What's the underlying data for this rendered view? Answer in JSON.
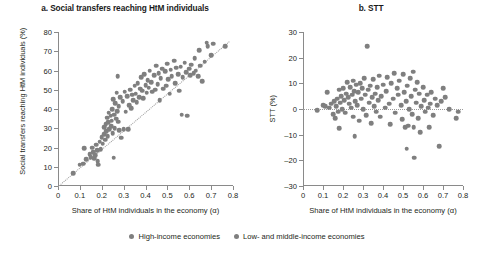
{
  "figure": {
    "panel_a_title": "a. Social transfers reaching HtM individuals",
    "panel_b_title": "b. STT"
  },
  "legend": {
    "items": [
      {
        "label": "High-income economies",
        "color": "#7f7f7f"
      },
      {
        "label": "Low- and middle-income economies",
        "color": "#7f7f7f"
      }
    ]
  },
  "chart_data": [
    {
      "type": "scatter",
      "id": "panel-a",
      "title": "a. Social transfers reaching HtM individuals",
      "xlabel": "Share of HtM individuals in the economy (α)",
      "ylabel": "Social transfers reaching HtM individuals (%)",
      "xlim": [
        0,
        0.8
      ],
      "ylim": [
        0,
        80
      ],
      "xticks": [
        0,
        0.1,
        0.2,
        0.3,
        0.4,
        0.5,
        0.6,
        0.7,
        0.8
      ],
      "xticklabels": [
        "0",
        "0.1",
        "0.2",
        "0.3",
        "0.4",
        "0.5",
        "0.6",
        "0.7",
        "0.8"
      ],
      "yticks": [
        0,
        10,
        20,
        30,
        40,
        50,
        60,
        70,
        80
      ],
      "yticklabels": [
        "0",
        "10",
        "20",
        "30",
        "40",
        "50",
        "60",
        "70",
        "80"
      ],
      "grid": false,
      "marker_color": "#7f7f7f",
      "trendline": {
        "style": "dotted",
        "x0": 0.0,
        "y0": 0.0,
        "x1": 0.78,
        "y1": 75.0
      },
      "points": [
        [
          0.07,
          6.5
        ],
        [
          0.1,
          11.0
        ],
        [
          0.115,
          11.5
        ],
        [
          0.12,
          19.5
        ],
        [
          0.13,
          14.0
        ],
        [
          0.145,
          16.5
        ],
        [
          0.15,
          15.0
        ],
        [
          0.155,
          20.0
        ],
        [
          0.16,
          17.5
        ],
        [
          0.165,
          14.5
        ],
        [
          0.17,
          16.0
        ],
        [
          0.175,
          21.5
        ],
        [
          0.18,
          18.5
        ],
        [
          0.182,
          13.0
        ],
        [
          0.185,
          11.0
        ],
        [
          0.19,
          23.0
        ],
        [
          0.195,
          19.0
        ],
        [
          0.2,
          25.5
        ],
        [
          0.205,
          22.0
        ],
        [
          0.21,
          27.0
        ],
        [
          0.212,
          30.5
        ],
        [
          0.215,
          24.0
        ],
        [
          0.218,
          32.0
        ],
        [
          0.22,
          28.5
        ],
        [
          0.225,
          35.5
        ],
        [
          0.228,
          26.0
        ],
        [
          0.23,
          33.0
        ],
        [
          0.232,
          38.0
        ],
        [
          0.235,
          29.5
        ],
        [
          0.24,
          36.5
        ],
        [
          0.242,
          31.0
        ],
        [
          0.245,
          34.0
        ],
        [
          0.248,
          40.0
        ],
        [
          0.25,
          27.5
        ],
        [
          0.252,
          45.0
        ],
        [
          0.255,
          14.8
        ],
        [
          0.258,
          37.0
        ],
        [
          0.26,
          30.0
        ],
        [
          0.262,
          43.0
        ],
        [
          0.265,
          35.0
        ],
        [
          0.268,
          48.5
        ],
        [
          0.27,
          39.0
        ],
        [
          0.272,
          57.0
        ],
        [
          0.275,
          33.5
        ],
        [
          0.278,
          41.5
        ],
        [
          0.28,
          29.0
        ],
        [
          0.285,
          46.0
        ],
        [
          0.29,
          25.0
        ],
        [
          0.295,
          44.0
        ],
        [
          0.3,
          29.5
        ],
        [
          0.305,
          49.0
        ],
        [
          0.31,
          38.5
        ],
        [
          0.315,
          46.5
        ],
        [
          0.32,
          29.5
        ],
        [
          0.325,
          42.0
        ],
        [
          0.33,
          50.0
        ],
        [
          0.335,
          40.5
        ],
        [
          0.34,
          47.5
        ],
        [
          0.345,
          44.5
        ],
        [
          0.35,
          52.0
        ],
        [
          0.355,
          48.0
        ],
        [
          0.36,
          43.5
        ],
        [
          0.365,
          53.5
        ],
        [
          0.37,
          46.0
        ],
        [
          0.375,
          50.5
        ],
        [
          0.38,
          56.5
        ],
        [
          0.385,
          49.5
        ],
        [
          0.39,
          45.5
        ],
        [
          0.395,
          58.0
        ],
        [
          0.4,
          52.5
        ],
        [
          0.405,
          48.5
        ],
        [
          0.41,
          55.0
        ],
        [
          0.415,
          51.0
        ],
        [
          0.42,
          60.0
        ],
        [
          0.425,
          54.0
        ],
        [
          0.43,
          49.0
        ],
        [
          0.44,
          57.5
        ],
        [
          0.445,
          50.0
        ],
        [
          0.45,
          62.5
        ],
        [
          0.455,
          53.0
        ],
        [
          0.46,
          58.5
        ],
        [
          0.465,
          44.5
        ],
        [
          0.47,
          56.0
        ],
        [
          0.475,
          61.0
        ],
        [
          0.48,
          50.5
        ],
        [
          0.49,
          59.5
        ],
        [
          0.495,
          52.0
        ],
        [
          0.5,
          63.5
        ],
        [
          0.505,
          55.5
        ],
        [
          0.51,
          48.0
        ],
        [
          0.515,
          60.5
        ],
        [
          0.52,
          57.0
        ],
        [
          0.53,
          65.0
        ],
        [
          0.535,
          53.5
        ],
        [
          0.54,
          61.5
        ],
        [
          0.55,
          58.0
        ],
        [
          0.555,
          49.5
        ],
        [
          0.56,
          62.0
        ],
        [
          0.565,
          37.0
        ],
        [
          0.57,
          56.5
        ],
        [
          0.58,
          64.0
        ],
        [
          0.585,
          59.0
        ],
        [
          0.59,
          36.5
        ],
        [
          0.6,
          61.0
        ],
        [
          0.605,
          57.5
        ],
        [
          0.61,
          63.0
        ],
        [
          0.62,
          58.5
        ],
        [
          0.625,
          66.5
        ],
        [
          0.63,
          60.0
        ],
        [
          0.64,
          57.0
        ],
        [
          0.645,
          70.5
        ],
        [
          0.65,
          62.5
        ],
        [
          0.66,
          54.5
        ],
        [
          0.67,
          64.5
        ],
        [
          0.68,
          74.5
        ],
        [
          0.685,
          72.5
        ],
        [
          0.7,
          68.0
        ],
        [
          0.71,
          74.0
        ],
        [
          0.765,
          72.5
        ]
      ]
    },
    {
      "type": "scatter",
      "id": "panel-b",
      "title": "b. STT",
      "xlabel": "Share of HtM individuals in the economy (α)",
      "ylabel": "STT (%)",
      "xlim": [
        0,
        0.8
      ],
      "ylim": [
        -30,
        30
      ],
      "xticks": [
        0,
        0.1,
        0.2,
        0.3,
        0.4,
        0.5,
        0.6,
        0.7,
        0.8
      ],
      "xticklabels": [
        "0",
        "0.1",
        "0.2",
        "0.3",
        "0.4",
        "0.5",
        "0.6",
        "0.7",
        "0.8"
      ],
      "yticks": [
        -30,
        -20,
        -10,
        0,
        10,
        20,
        30
      ],
      "yticklabels": [
        "–30",
        "–20",
        "–10",
        "0",
        "10",
        "20",
        "30"
      ],
      "grid": false,
      "marker_color": "#7f7f7f",
      "zero_line": {
        "style": "dotted",
        "y": 0
      },
      "points": [
        [
          0.07,
          -0.5
        ],
        [
          0.1,
          1.5
        ],
        [
          0.11,
          1.0
        ],
        [
          0.12,
          6.5
        ],
        [
          0.13,
          0.5
        ],
        [
          0.14,
          2.0
        ],
        [
          0.15,
          -2.0
        ],
        [
          0.155,
          3.0
        ],
        [
          0.16,
          -3.5
        ],
        [
          0.165,
          1.0
        ],
        [
          0.17,
          4.0
        ],
        [
          0.175,
          -1.0
        ],
        [
          0.18,
          7.5
        ],
        [
          0.182,
          -7.5
        ],
        [
          0.185,
          2.5
        ],
        [
          0.19,
          5.0
        ],
        [
          0.195,
          0.0
        ],
        [
          0.2,
          8.0
        ],
        [
          0.205,
          3.5
        ],
        [
          0.21,
          -1.5
        ],
        [
          0.215,
          6.0
        ],
        [
          0.22,
          10.5
        ],
        [
          0.225,
          4.5
        ],
        [
          0.23,
          2.0
        ],
        [
          0.235,
          8.5
        ],
        [
          0.24,
          0.5
        ],
        [
          0.245,
          5.5
        ],
        [
          0.25,
          11.0
        ],
        [
          0.252,
          -3.0
        ],
        [
          0.255,
          7.0
        ],
        [
          0.258,
          -10.5
        ],
        [
          0.26,
          3.0
        ],
        [
          0.265,
          9.5
        ],
        [
          0.27,
          1.5
        ],
        [
          0.275,
          6.5
        ],
        [
          0.28,
          -4.5
        ],
        [
          0.285,
          10.0
        ],
        [
          0.29,
          4.0
        ],
        [
          0.295,
          8.0
        ],
        [
          0.3,
          0.0
        ],
        [
          0.305,
          12.0
        ],
        [
          0.31,
          5.5
        ],
        [
          0.315,
          -2.5
        ],
        [
          0.32,
          24.5
        ],
        [
          0.325,
          7.5
        ],
        [
          0.33,
          2.5
        ],
        [
          0.335,
          9.0
        ],
        [
          0.34,
          -5.5
        ],
        [
          0.345,
          4.5
        ],
        [
          0.35,
          11.5
        ],
        [
          0.355,
          1.0
        ],
        [
          0.36,
          6.0
        ],
        [
          0.365,
          -1.0
        ],
        [
          0.37,
          8.5
        ],
        [
          0.375,
          3.5
        ],
        [
          0.38,
          13.0
        ],
        [
          0.385,
          -3.0
        ],
        [
          0.39,
          5.0
        ],
        [
          0.4,
          9.5
        ],
        [
          0.41,
          0.5
        ],
        [
          0.415,
          7.0
        ],
        [
          0.42,
          12.5
        ],
        [
          0.43,
          2.0
        ],
        [
          0.435,
          -6.0
        ],
        [
          0.44,
          10.0
        ],
        [
          0.45,
          4.0
        ],
        [
          0.455,
          14.0
        ],
        [
          0.46,
          -1.5
        ],
        [
          0.47,
          8.0
        ],
        [
          0.475,
          5.5
        ],
        [
          0.48,
          11.0
        ],
        [
          0.49,
          1.5
        ],
        [
          0.495,
          -4.0
        ],
        [
          0.5,
          13.5
        ],
        [
          0.505,
          6.5
        ],
        [
          0.51,
          -7.0
        ],
        [
          0.515,
          3.0
        ],
        [
          0.518,
          -15.5
        ],
        [
          0.52,
          9.0
        ],
        [
          0.525,
          -6.5
        ],
        [
          0.53,
          0.0
        ],
        [
          0.535,
          12.0
        ],
        [
          0.54,
          5.0
        ],
        [
          0.545,
          -2.0
        ],
        [
          0.55,
          14.5
        ],
        [
          0.553,
          -7.0
        ],
        [
          0.555,
          -19.0
        ],
        [
          0.56,
          7.5
        ],
        [
          0.565,
          2.5
        ],
        [
          0.57,
          10.5
        ],
        [
          0.575,
          -3.5
        ],
        [
          0.58,
          6.0
        ],
        [
          0.585,
          -9.0
        ],
        [
          0.59,
          1.0
        ],
        [
          0.6,
          8.5
        ],
        [
          0.605,
          3.5
        ],
        [
          0.61,
          -1.0
        ],
        [
          0.62,
          5.5
        ],
        [
          0.625,
          0.5
        ],
        [
          0.63,
          -7.0
        ],
        [
          0.635,
          2.0
        ],
        [
          0.64,
          6.5
        ],
        [
          0.65,
          -2.5
        ],
        [
          0.66,
          4.0
        ],
        [
          0.67,
          1.5
        ],
        [
          0.68,
          -14.5
        ],
        [
          0.69,
          3.0
        ],
        [
          0.7,
          8.0
        ],
        [
          0.71,
          4.5
        ],
        [
          0.73,
          0.0
        ],
        [
          0.765,
          -3.5
        ],
        [
          0.775,
          -1.0
        ]
      ]
    }
  ]
}
